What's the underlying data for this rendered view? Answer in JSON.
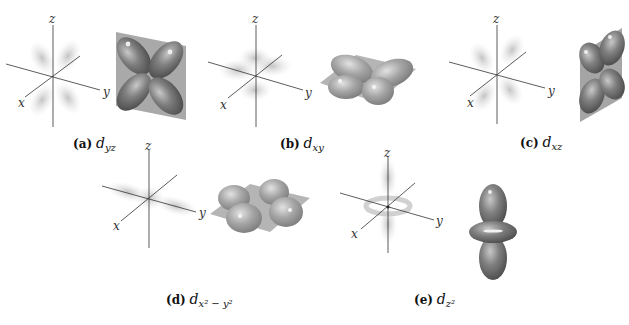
{
  "figure": {
    "panels": [
      {
        "id": "a",
        "tag": "(a)",
        "orbital": "d",
        "subscript": "yz",
        "superscript": "",
        "axes": {
          "x": "x",
          "y": "y",
          "z": "z"
        }
      },
      {
        "id": "b",
        "tag": "(b)",
        "orbital": "d",
        "subscript": "xy",
        "superscript": "",
        "axes": {
          "x": "x",
          "y": "y",
          "z": "z"
        }
      },
      {
        "id": "c",
        "tag": "(c)",
        "orbital": "d",
        "subscript": "xz",
        "superscript": "",
        "axes": {
          "x": "x",
          "y": "y",
          "z": "z"
        }
      },
      {
        "id": "d",
        "tag": "(d)",
        "orbital": "d",
        "subscript": "x² − y²",
        "superscript": "",
        "axes": {
          "x": "x",
          "y": "y",
          "z": "z"
        }
      },
      {
        "id": "e",
        "tag": "(e)",
        "orbital": "d",
        "subscript": "z²",
        "superscript": "",
        "axes": {
          "x": "x",
          "y": "y",
          "z": "z"
        }
      }
    ],
    "colors": {
      "lobe": "#8a8a8a",
      "lobe_dark": "#555555",
      "plane": "#a8a8a8",
      "axis": "#333333",
      "cloud": "#c8c8c8"
    }
  }
}
